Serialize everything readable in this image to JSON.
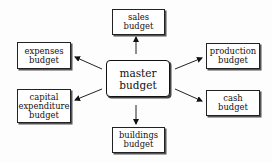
{
  "diagram": {
    "center": {
      "line1": "master",
      "line2": "budget"
    },
    "nodes": [
      {
        "id": "sales",
        "lines": [
          "sales",
          "budget"
        ]
      },
      {
        "id": "expenses",
        "lines": [
          "expenses",
          "budget"
        ]
      },
      {
        "id": "production",
        "lines": [
          "production",
          "budget"
        ]
      },
      {
        "id": "capital",
        "lines": [
          "capital",
          "expenditure",
          "budget"
        ]
      },
      {
        "id": "cash",
        "lines": [
          "cash",
          "budget"
        ]
      },
      {
        "id": "buildings",
        "lines": [
          "buildings",
          "budget"
        ]
      }
    ],
    "edges": [
      {
        "from": "master",
        "to": "sales"
      },
      {
        "from": "master",
        "to": "expenses"
      },
      {
        "from": "master",
        "to": "production"
      },
      {
        "from": "master",
        "to": "capital"
      },
      {
        "from": "master",
        "to": "cash"
      },
      {
        "from": "master",
        "to": "buildings"
      }
    ]
  }
}
